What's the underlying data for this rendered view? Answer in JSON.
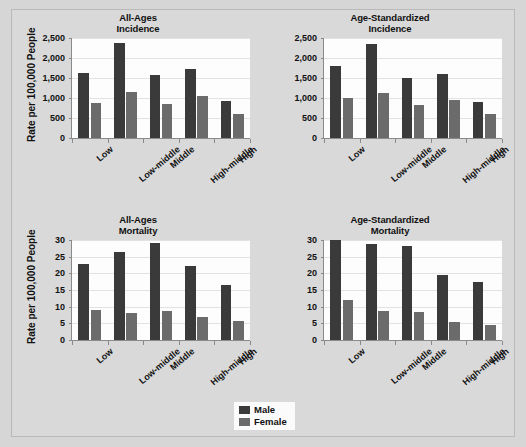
{
  "figure": {
    "background_color": "#d9d9d9",
    "male_color": "#3a3a3a",
    "female_color": "#6b6b6b"
  },
  "legend": {
    "position": "bottom-center",
    "entries": [
      {
        "label": "Male",
        "color": "#3a3a3a"
      },
      {
        "label": "Female",
        "color": "#6b6b6b"
      }
    ]
  },
  "chart_data": [
    {
      "type": "bar",
      "title": "All-Ages Incidence",
      "title_line1": "All-Ages",
      "title_line2": "Incidence",
      "xlabel": "",
      "ylabel": "Rate per 100,000 People",
      "categories": [
        "Low",
        "Low-middle",
        "Middle",
        "High-middle",
        "High"
      ],
      "ylim": [
        0,
        2500
      ],
      "yticks": [
        0,
        500,
        1000,
        1500,
        2000,
        2500
      ],
      "ytick_labels": [
        "0",
        "500",
        "1,000",
        "1,500",
        "2,000",
        "2,500"
      ],
      "grid": true,
      "series": [
        {
          "name": "Male",
          "values": [
            1620,
            2370,
            1580,
            1720,
            920
          ]
        },
        {
          "name": "Female",
          "values": [
            880,
            1160,
            850,
            1050,
            610
          ]
        }
      ]
    },
    {
      "type": "bar",
      "title": "Age-Standardized Incidence",
      "title_line1": "Age-Standardized",
      "title_line2": "Incidence",
      "xlabel": "",
      "ylabel": "",
      "categories": [
        "Low",
        "Low-middle",
        "Middle",
        "High-middle",
        "High"
      ],
      "ylim": [
        0,
        2500
      ],
      "yticks": [
        0,
        500,
        1000,
        1500,
        2000,
        2500
      ],
      "ytick_labels": [
        "0",
        "500",
        "1,000",
        "1,500",
        "2,000",
        "2,500"
      ],
      "grid": true,
      "series": [
        {
          "name": "Male",
          "values": [
            1810,
            2360,
            1500,
            1600,
            900
          ]
        },
        {
          "name": "Female",
          "values": [
            1010,
            1120,
            820,
            940,
            610
          ]
        }
      ]
    },
    {
      "type": "bar",
      "title": "All-Ages Mortality",
      "title_line1": "All-Ages",
      "title_line2": "Mortality",
      "xlabel": "",
      "ylabel": "Rate per 100,000 People",
      "categories": [
        "Low",
        "Low-middle",
        "Middle",
        "High-middle",
        "High"
      ],
      "ylim": [
        0,
        30
      ],
      "yticks": [
        0,
        5,
        10,
        15,
        20,
        25,
        30
      ],
      "ytick_labels": [
        "0",
        "5",
        "10",
        "15",
        "20",
        "25",
        "30"
      ],
      "grid": true,
      "series": [
        {
          "name": "Male",
          "values": [
            22.8,
            26.5,
            29.1,
            22.2,
            16.6
          ]
        },
        {
          "name": "Female",
          "values": [
            9.1,
            8.0,
            8.7,
            6.8,
            5.6
          ]
        }
      ]
    },
    {
      "type": "bar",
      "title": "Age-Standardized Mortality",
      "title_line1": "Age-Standardized",
      "title_line2": "Mortality",
      "xlabel": "",
      "ylabel": "",
      "categories": [
        "Low",
        "Low-middle",
        "Middle",
        "High-middle",
        "High"
      ],
      "ylim": [
        0,
        30
      ],
      "yticks": [
        0,
        5,
        10,
        15,
        20,
        25,
        30
      ],
      "ytick_labels": [
        "0",
        "5",
        "10",
        "15",
        "20",
        "25",
        "30"
      ],
      "grid": true,
      "series": [
        {
          "name": "Male",
          "values": [
            30.0,
            28.7,
            28.1,
            19.4,
            17.3
          ]
        },
        {
          "name": "Female",
          "values": [
            12.1,
            8.8,
            8.5,
            5.5,
            4.5
          ]
        }
      ]
    }
  ]
}
